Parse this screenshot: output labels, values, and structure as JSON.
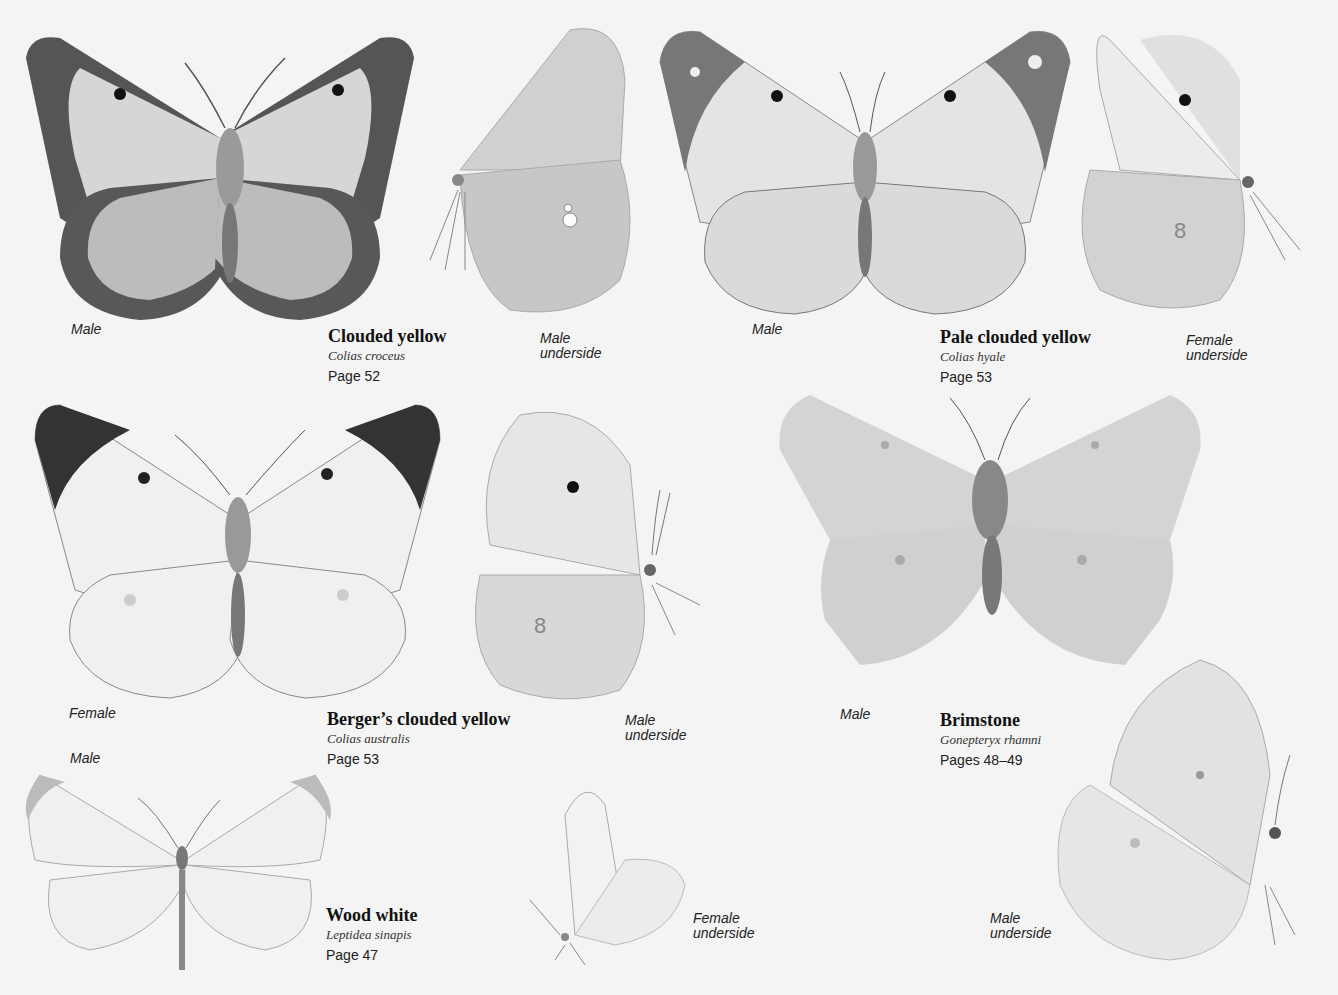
{
  "page": {
    "background": "#f4f4f4"
  },
  "species": [
    {
      "common_name": "Clouded yellow",
      "latin_name": "Colias croceus",
      "page_ref": "Page 52",
      "figures": [
        {
          "label": "Male",
          "view": "upperside"
        },
        {
          "label": "Male\nunderside",
          "view": "underside"
        }
      ]
    },
    {
      "common_name": "Pale clouded yellow",
      "latin_name": "Colias hyale",
      "page_ref": "Page 53",
      "figures": [
        {
          "label": "Male",
          "view": "upperside"
        },
        {
          "label": "Female\nunderside",
          "view": "underside"
        }
      ]
    },
    {
      "common_name": "Berger’s clouded yellow",
      "latin_name": "Colias australis",
      "page_ref": "Page 53",
      "figures": [
        {
          "label": "Female",
          "view": "upperside"
        },
        {
          "label": "Male\nunderside",
          "view": "underside"
        }
      ]
    },
    {
      "common_name": "Brimstone",
      "latin_name": "Gonepteryx rhamni",
      "page_ref": "Pages 48–49",
      "figures": [
        {
          "label": "Male",
          "view": "upperside"
        },
        {
          "label": "Male\nunderside",
          "view": "underside"
        }
      ]
    },
    {
      "common_name": "Wood white",
      "latin_name": "Leptidea sinapis",
      "page_ref": "Page 47",
      "figures": [
        {
          "label": "Male",
          "view": "upperside"
        },
        {
          "label": "Female\nunderside",
          "view": "underside"
        }
      ]
    }
  ],
  "labels": {
    "clouded_male": "Male",
    "clouded_under_1": "Male",
    "clouded_under_2": "underside",
    "pale_male": "Male",
    "pale_under_1": "Female",
    "pale_under_2": "underside",
    "berger_female": "Female",
    "berger_under_1": "Male",
    "berger_under_2": "underside",
    "brim_male": "Male",
    "brim_under_1": "Male",
    "brim_under_2": "underside",
    "wood_male": "Male",
    "wood_under_1": "Female",
    "wood_under_2": "underside"
  }
}
